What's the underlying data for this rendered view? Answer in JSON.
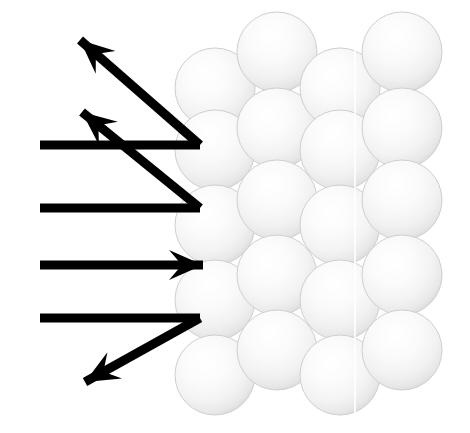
{
  "figure": {
    "title": "Specular scattering of a beam from a close-packed atomic surface",
    "background_color": "#ffffff",
    "width": 470,
    "height": 433,
    "caption": "",
    "labels": []
  },
  "palette": {
    "ray_color": "#000000",
    "sphere_fill_light": "#fdfdfd",
    "sphere_fill_mid": "#f2f2f2",
    "sphere_fill_edge": "#d9d9d9",
    "sphere_outline": "#cfcfcf",
    "background": "#ffffff"
  },
  "chart_data": {
    "type": "diagram",
    "title": "Specular scattering of a beam from a close-packed atomic surface",
    "xlabel": "",
    "ylabel": "",
    "xlim": [
      0,
      470
    ],
    "ylim": [
      0,
      433
    ],
    "grid": false,
    "legend": "none",
    "lattice": {
      "description": "Close-packed array of spheres representing surface atoms; alternating columns offset vertically (hexagonal packing).",
      "sphere_radius": 40,
      "column_spacing": 62,
      "row_spacing": 74,
      "columns": [
        {
          "index": 0,
          "cx": 215,
          "centers_y": [
            88,
            150,
            225,
            300,
            375
          ]
        },
        {
          "index": 1,
          "cx": 277,
          "centers_y": [
            52,
            128,
            200,
            275,
            350
          ]
        },
        {
          "index": 2,
          "cx": 340,
          "centers_y": [
            88,
            150,
            225,
            300,
            375
          ]
        },
        {
          "index": 3,
          "cx": 402,
          "centers_y": [
            52,
            128,
            200,
            275,
            350
          ]
        }
      ],
      "sphere_count": 20
    },
    "rays": [
      {
        "id": "ray-1-incident",
        "label": "incident beam 1",
        "direction": "horizontal-right",
        "points": [
          [
            40,
            145
          ],
          [
            200,
            145
          ]
        ],
        "arrowhead": "none"
      },
      {
        "id": "ray-1-reflected",
        "label": "reflected beam 1 (up-left, shallow)",
        "direction": "up-left",
        "points": [
          [
            200,
            145
          ],
          [
            80,
            40
          ]
        ],
        "arrowhead": "up-left"
      },
      {
        "id": "ray-2-incident",
        "label": "incident beam 2",
        "direction": "horizontal-right",
        "points": [
          [
            40,
            208
          ],
          [
            200,
            208
          ]
        ],
        "arrowhead": "none"
      },
      {
        "id": "ray-2-reflected",
        "label": "reflected beam 2 (up-left, steep)",
        "direction": "up-left",
        "points": [
          [
            200,
            208
          ],
          [
            82,
            112
          ]
        ],
        "arrowhead": "up-left"
      },
      {
        "id": "ray-3-incident",
        "label": "incident beam 3 (specular, undeviated)",
        "direction": "horizontal-right",
        "points": [
          [
            40,
            265
          ],
          [
            203,
            265
          ]
        ],
        "arrowhead": "right"
      },
      {
        "id": "ray-4-incident",
        "label": "incident beam 4",
        "direction": "horizontal-right",
        "points": [
          [
            40,
            318
          ],
          [
            200,
            318
          ]
        ],
        "arrowhead": "none"
      },
      {
        "id": "ray-4-reflected",
        "label": "reflected beam 4 (down-left)",
        "direction": "down-left",
        "points": [
          [
            200,
            318
          ],
          [
            85,
            382
          ]
        ],
        "arrowhead": "down-left"
      }
    ],
    "ray_count": 7,
    "incident_ray_count": 4,
    "reflected_ray_count": 3,
    "ray_thickness": 9
  }
}
